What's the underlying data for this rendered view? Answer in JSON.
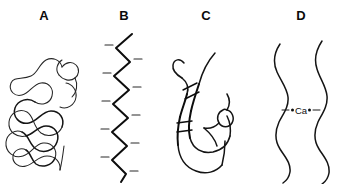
{
  "figure": {
    "background_color": "#ffffff",
    "ink_color": "#111111",
    "width": 350,
    "height": 184
  },
  "panels": [
    {
      "id": "a",
      "label": "A",
      "art_name": "random-coil-diagram"
    },
    {
      "id": "b",
      "label": "B",
      "art_name": "zigzag-chain-diagram"
    },
    {
      "id": "c",
      "label": "C",
      "art_name": "junction-zone-diagram"
    },
    {
      "id": "d",
      "label": "D",
      "art_name": "calcium-bridge-diagram"
    }
  ],
  "annotations": {
    "calcium_ion_label": "Ca"
  }
}
